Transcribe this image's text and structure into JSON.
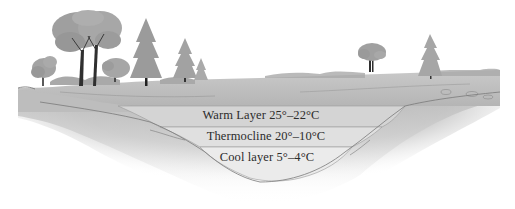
{
  "diagram": {
    "layers": [
      {
        "label": "Warm Layer 25°–22°C",
        "name": "warm-layer",
        "fill": "#d6d6d6"
      },
      {
        "label": "Thermocline 20°–10°C",
        "name": "thermocline",
        "fill": "#e2e2e2"
      },
      {
        "label": "Cool layer 5°–4°C",
        "name": "cool-layer",
        "fill": "#ececec"
      }
    ],
    "colors": {
      "background": "#ffffff",
      "ground": "#b9b9b9",
      "ground_dark": "#8f8f8f",
      "tree_foliage": "#9a9a9a",
      "tree_trunk": "#3a3a3a",
      "text": "#2c2c2c"
    }
  }
}
